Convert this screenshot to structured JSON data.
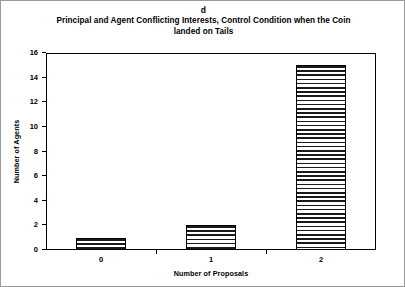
{
  "figure": {
    "panel_label": "d",
    "title_line1": "Principal and Agent Conflicting Interests, Control Condition when the Coin",
    "title_line2": "landed on Tails",
    "frame_color": "#9a9a9a",
    "bar_outline_color": "#000000",
    "bar_fill_pattern": "horizontal-stripes"
  },
  "chart_data": {
    "type": "bar",
    "title": "Principal and Agent Conflicting Interests, Control Condition when the Coin landed on Tails",
    "panel": "d",
    "categories": [
      "0",
      "1",
      "2"
    ],
    "values": [
      1,
      2,
      15
    ],
    "xlabel": "Number of Proposals",
    "ylabel": "Number of Agents",
    "ylim": [
      0,
      16
    ],
    "ytick_step": 2,
    "yticks": [
      0,
      2,
      4,
      6,
      8,
      10,
      12,
      14,
      16
    ],
    "ytick_labels": [
      "0",
      "2",
      "4",
      "6",
      "8",
      "10",
      "12",
      "14",
      "16"
    ],
    "grid": false,
    "legend": null
  }
}
